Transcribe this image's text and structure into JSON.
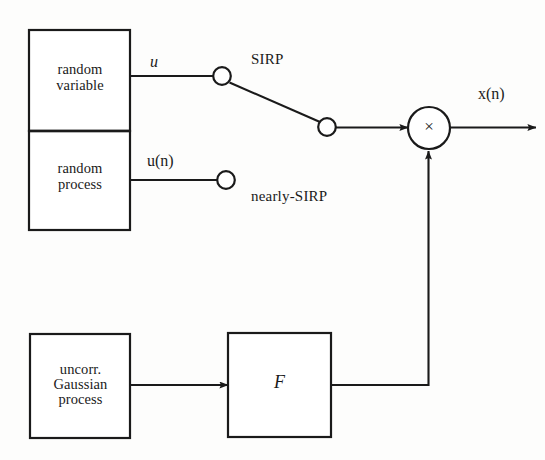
{
  "figure": {
    "type": "block-diagram",
    "background_color": "#fdfdfc",
    "line_color": "#1a1a1a"
  },
  "blocks": {
    "random_variable": {
      "label": "random\nvariable",
      "x": 29,
      "y": 30,
      "width": 101,
      "height": 101
    },
    "random_process": {
      "label": "random\nprocess",
      "x": 29,
      "y": 131,
      "width": 101,
      "height": 99
    },
    "uncorrelated_gaussian": {
      "label": "uncorr.\nGaussian\nprocess",
      "x": 30,
      "y": 334,
      "width": 100,
      "height": 104
    },
    "filter": {
      "label": "F",
      "x": 228,
      "y": 333,
      "width": 103,
      "height": 104
    }
  },
  "nodes": {
    "multiplier": {
      "symbol": "×",
      "cx": 429,
      "cy": 128,
      "r": 21
    },
    "contact_sirp": {
      "cx": 222,
      "cy": 76,
      "r": 9
    },
    "contact_pole": {
      "cx": 327,
      "cy": 127,
      "r": 9
    },
    "contact_nearly_sirp": {
      "cx": 226,
      "cy": 180,
      "r": 9
    }
  },
  "labels": {
    "u": "u",
    "u_of_n": "u(n)",
    "sirp": "SIRP",
    "nearly_sirp": "nearly-SIRP",
    "x_of_n": "x(n)",
    "times_symbol": "×",
    "filter_symbol": "F"
  },
  "signals": [
    {
      "name": "u-branch",
      "from": "random_variable",
      "to": "contact_sirp",
      "label": "u"
    },
    {
      "name": "un-branch",
      "from": "random_process",
      "to": "contact_nearly_sirp",
      "label": "u(n)"
    },
    {
      "name": "switch-arm",
      "from": "contact_sirp",
      "to": "contact_pole",
      "label": ""
    },
    {
      "name": "pole-to-multiplier",
      "from": "contact_pole",
      "to": "multiplier",
      "label": ""
    },
    {
      "name": "gaussian-to-filter",
      "from": "uncorrelated_gaussian",
      "to": "filter",
      "label": ""
    },
    {
      "name": "filter-feedback",
      "from": "filter",
      "to": "multiplier",
      "label": ""
    },
    {
      "name": "output",
      "from": "multiplier",
      "to": "",
      "label": "x(n)"
    }
  ]
}
